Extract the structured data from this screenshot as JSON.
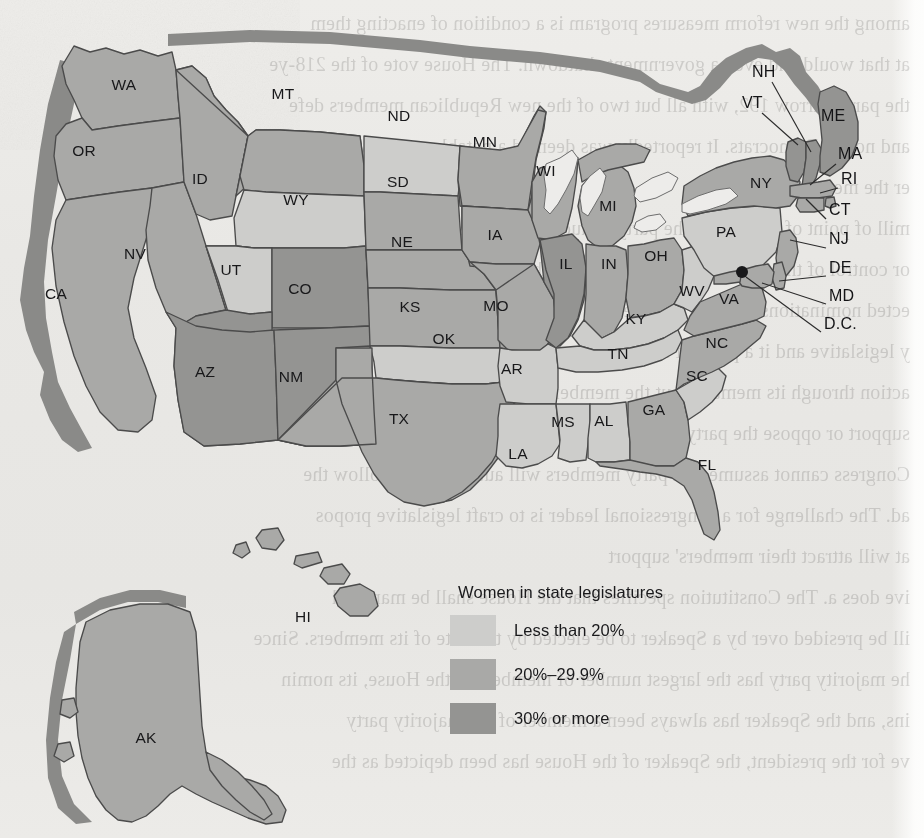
{
  "legend": {
    "title": "Women in state legislatures",
    "classes": [
      {
        "key": "lo",
        "label": "Less than 20%",
        "color": "#cdcdcb"
      },
      {
        "key": "mid",
        "label": "20%–29.9%",
        "color": "#a9a9a7"
      },
      {
        "key": "hi",
        "label": "30% or more",
        "color": "#949492"
      }
    ]
  },
  "chart_data": {
    "type": "map",
    "subtype": "choropleth",
    "title": "Women in state legislatures",
    "legend_position": "center-bottom",
    "bins": [
      "Less than 20%",
      "20%–29.9%",
      "30% or more"
    ],
    "bin_colors": [
      "#cdcdcb",
      "#a9a9a7",
      "#949492"
    ],
    "units": "percent of state legislature seats held by women",
    "regions": [
      {
        "code": "WA",
        "bin": "20%–29.9%"
      },
      {
        "code": "OR",
        "bin": "20%–29.9%"
      },
      {
        "code": "CA",
        "bin": "20%–29.9%"
      },
      {
        "code": "NV",
        "bin": "20%–29.9%"
      },
      {
        "code": "ID",
        "bin": "20%–29.9%"
      },
      {
        "code": "MT",
        "bin": "20%–29.9%"
      },
      {
        "code": "WY",
        "bin": "Less than 20%"
      },
      {
        "code": "UT",
        "bin": "Less than 20%"
      },
      {
        "code": "AZ",
        "bin": "30% or more"
      },
      {
        "code": "CO",
        "bin": "30% or more"
      },
      {
        "code": "NM",
        "bin": "30% or more"
      },
      {
        "code": "ND",
        "bin": "Less than 20%"
      },
      {
        "code": "SD",
        "bin": "20%–29.9%"
      },
      {
        "code": "NE",
        "bin": "20%–29.9%"
      },
      {
        "code": "KS",
        "bin": "20%–29.9%"
      },
      {
        "code": "OK",
        "bin": "Less than 20%"
      },
      {
        "code": "TX",
        "bin": "20%–29.9%"
      },
      {
        "code": "MN",
        "bin": "20%–29.9%"
      },
      {
        "code": "IA",
        "bin": "20%–29.9%"
      },
      {
        "code": "MO",
        "bin": "20%–29.9%"
      },
      {
        "code": "AR",
        "bin": "Less than 20%"
      },
      {
        "code": "LA",
        "bin": "Less than 20%"
      },
      {
        "code": "WI",
        "bin": "20%–29.9%"
      },
      {
        "code": "IL",
        "bin": "30% or more"
      },
      {
        "code": "MI",
        "bin": "20%–29.9%"
      },
      {
        "code": "IN",
        "bin": "20%–29.9%"
      },
      {
        "code": "OH",
        "bin": "20%–29.9%"
      },
      {
        "code": "KY",
        "bin": "Less than 20%"
      },
      {
        "code": "TN",
        "bin": "Less than 20%"
      },
      {
        "code": "MS",
        "bin": "Less than 20%"
      },
      {
        "code": "AL",
        "bin": "Less than 20%"
      },
      {
        "code": "GA",
        "bin": "20%–29.9%"
      },
      {
        "code": "FL",
        "bin": "20%–29.9%"
      },
      {
        "code": "SC",
        "bin": "Less than 20%"
      },
      {
        "code": "NC",
        "bin": "20%–29.9%"
      },
      {
        "code": "VA",
        "bin": "20%–29.9%"
      },
      {
        "code": "WV",
        "bin": "Less than 20%"
      },
      {
        "code": "PA",
        "bin": "Less than 20%"
      },
      {
        "code": "NY",
        "bin": "20%–29.9%"
      },
      {
        "code": "VT",
        "bin": "30% or more"
      },
      {
        "code": "NH",
        "bin": "30% or more"
      },
      {
        "code": "ME",
        "bin": "30% or more"
      },
      {
        "code": "MA",
        "bin": "20%–29.9%"
      },
      {
        "code": "RI",
        "bin": "20%–29.9%"
      },
      {
        "code": "CT",
        "bin": "20%–29.9%"
      },
      {
        "code": "NJ",
        "bin": "20%–29.9%"
      },
      {
        "code": "DE",
        "bin": "20%–29.9%"
      },
      {
        "code": "MD",
        "bin": "20%–29.9%"
      },
      {
        "code": "D.C.",
        "bin": "30% or more"
      },
      {
        "code": "AK",
        "bin": "20%–29.9%"
      },
      {
        "code": "HI",
        "bin": "20%–29.9%"
      }
    ]
  },
  "map": {
    "inline_labels": [
      {
        "code": "WA",
        "x": 124,
        "y": 86
      },
      {
        "code": "OR",
        "x": 84,
        "y": 152
      },
      {
        "code": "ID",
        "x": 200,
        "y": 180
      },
      {
        "code": "MT",
        "x": 283,
        "y": 95
      },
      {
        "code": "WY",
        "x": 296,
        "y": 201
      },
      {
        "code": "NV",
        "x": 135,
        "y": 255
      },
      {
        "code": "CA",
        "x": 56,
        "y": 295
      },
      {
        "code": "UT",
        "x": 231,
        "y": 271
      },
      {
        "code": "AZ",
        "x": 205,
        "y": 373
      },
      {
        "code": "NM",
        "x": 291,
        "y": 378
      },
      {
        "code": "CO",
        "x": 300,
        "y": 290
      },
      {
        "code": "ND",
        "x": 399,
        "y": 117
      },
      {
        "code": "SD",
        "x": 398,
        "y": 183
      },
      {
        "code": "NE",
        "x": 402,
        "y": 243
      },
      {
        "code": "KS",
        "x": 410,
        "y": 308
      },
      {
        "code": "OK",
        "x": 444,
        "y": 340
      },
      {
        "code": "TX",
        "x": 399,
        "y": 420
      },
      {
        "code": "MN",
        "x": 485,
        "y": 143
      },
      {
        "code": "IA",
        "x": 495,
        "y": 236
      },
      {
        "code": "MO",
        "x": 496,
        "y": 307
      },
      {
        "code": "AR",
        "x": 512,
        "y": 370
      },
      {
        "code": "LA",
        "x": 518,
        "y": 455
      },
      {
        "code": "WI",
        "x": 546,
        "y": 172
      },
      {
        "code": "IL",
        "x": 566,
        "y": 265
      },
      {
        "code": "MI",
        "x": 608,
        "y": 207
      },
      {
        "code": "IN",
        "x": 609,
        "y": 265
      },
      {
        "code": "OH",
        "x": 656,
        "y": 257
      },
      {
        "code": "KY",
        "x": 636,
        "y": 320
      },
      {
        "code": "TN",
        "x": 618,
        "y": 355
      },
      {
        "code": "MS",
        "x": 563,
        "y": 423
      },
      {
        "code": "AL",
        "x": 604,
        "y": 422
      },
      {
        "code": "GA",
        "x": 654,
        "y": 411
      },
      {
        "code": "FL",
        "x": 707,
        "y": 466
      },
      {
        "code": "SC",
        "x": 697,
        "y": 377
      },
      {
        "code": "NC",
        "x": 717,
        "y": 344
      },
      {
        "code": "VA",
        "x": 729,
        "y": 300
      },
      {
        "code": "WV",
        "x": 692,
        "y": 292
      },
      {
        "code": "PA",
        "x": 726,
        "y": 233
      },
      {
        "code": "NY",
        "x": 761,
        "y": 184
      },
      {
        "code": "AK",
        "x": 146,
        "y": 739
      },
      {
        "code": "HI",
        "x": 303,
        "y": 618
      }
    ],
    "callout_labels": [
      {
        "code": "NH",
        "tx": 752,
        "ty": 73,
        "lx": 772,
        "ly": 82,
        "px": 811,
        "py": 152
      },
      {
        "code": "VT",
        "tx": 742,
        "ty": 104,
        "lx": 762,
        "ly": 113,
        "px": 798,
        "py": 145
      },
      {
        "code": "ME",
        "tx": 821,
        "ty": 117,
        "lx": 819,
        "ly": 126,
        "px": 819,
        "py": 126
      },
      {
        "code": "MA",
        "tx": 838,
        "ty": 155,
        "lx": 836,
        "ly": 164,
        "px": 810,
        "py": 185
      },
      {
        "code": "RI",
        "tx": 841,
        "ty": 180,
        "lx": 838,
        "ly": 188,
        "px": 820,
        "py": 193
      },
      {
        "code": "CT",
        "tx": 829,
        "ty": 211,
        "lx": 826,
        "ly": 219,
        "px": 806,
        "py": 199
      },
      {
        "code": "NJ",
        "tx": 829,
        "ty": 240,
        "lx": 826,
        "ly": 248,
        "px": 790,
        "py": 240
      },
      {
        "code": "DE",
        "tx": 829,
        "ty": 269,
        "lx": 826,
        "ly": 276,
        "px": 779,
        "py": 281
      },
      {
        "code": "MD",
        "tx": 829,
        "ty": 297,
        "lx": 826,
        "ly": 304,
        "px": 762,
        "py": 283
      },
      {
        "code": "D.C.",
        "tx": 824,
        "ty": 325,
        "lx": 821,
        "ly": 332,
        "px": 746,
        "py": 277
      }
    ],
    "dc_dot": {
      "x": 742,
      "y": 272,
      "r": 6
    }
  },
  "showthrough_lines": [
    "among the new reform measures program is a condition of enacting them",
    "at that would end even a government shutdown. The House vote of the 218-ye",
    "the party narrow 192, with all but two of the new Republican members defe",
    "and not all Democrats. It reportedly was deemed a notable consensus",
    "er the measure's passage.",
    "mill of point of strategy in the party's caucus as a predict to each",
    "or control of the Congress then is critical to the parties, so not to be",
    "ected nominations in a party. The effect nomination of the party lead",
    "y legislative and it a point of legislative caucus. That is largely w",
    "action through its members but the members the freedom to selective",
    "support or oppose the party's position or policy. Accordingly, party lead",
    "Congress cannot assume that party members will automatically follow the",
    "ad. The challenge for a congressional leader is to craft legislative propos",
    "at will attract their members' support",
    "ive does a. The Constitution specifies that the House shall be managed",
    "ill be presided over by a Speaker to be elected by the vote of its members. Since",
    "he majority party has the largest number of members in the House, its nomin",
    "ins, and the Speaker has always been a member of the majority party",
    "ve for the president, the Speaker of the House has been depicted as the"
  ]
}
